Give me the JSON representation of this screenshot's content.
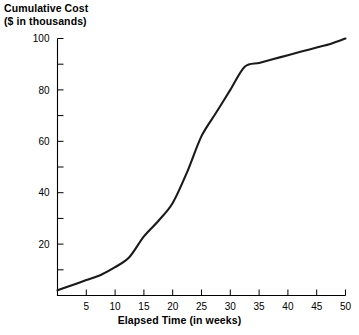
{
  "chart_data": {
    "type": "line",
    "title": "",
    "ylabel": "Cumulative Cost\n($ in thousands)",
    "ylabel_line1": "Cumulative Cost",
    "ylabel_line2": "($ in thousands)",
    "xlabel": "Elapsed Time (in weeks)",
    "xlim": [
      0,
      50
    ],
    "ylim": [
      0,
      100
    ],
    "x_ticks": [
      5,
      10,
      15,
      20,
      25,
      30,
      35,
      40,
      45,
      50
    ],
    "x_tick_labels": [
      "5",
      "10",
      "15",
      "20",
      "25",
      "30",
      "35",
      "40",
      "45",
      "50"
    ],
    "y_ticks": [
      0,
      10,
      20,
      30,
      40,
      50,
      60,
      70,
      80,
      90,
      100
    ],
    "y_tick_labels": [
      "20",
      "40",
      "60",
      "80",
      "100"
    ],
    "y_labeled_ticks": [
      20,
      40,
      60,
      80,
      100
    ],
    "grid": false,
    "legend": "none",
    "line_color": "#1a1a1a",
    "series": [
      {
        "name": "Cumulative Cost",
        "x": [
          0,
          2.5,
          5,
          7.5,
          10,
          12.5,
          15,
          17.5,
          20,
          22.5,
          25,
          27.5,
          30,
          32.5,
          35,
          37.5,
          40,
          42.5,
          45,
          47.5,
          50
        ],
        "values": [
          2,
          4,
          6,
          8,
          11,
          15,
          23,
          29,
          36,
          48,
          62,
          71,
          80,
          89,
          90.5,
          92,
          93.5,
          95,
          96.5,
          98,
          100
        ]
      }
    ]
  }
}
